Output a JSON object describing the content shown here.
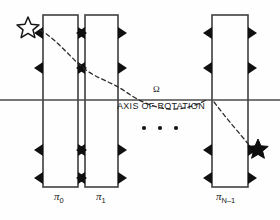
{
  "diagram": {
    "axis": {
      "label": "AXIS OF ROTATION",
      "omega_symbol": "Ω",
      "y": 100,
      "x_start": 0,
      "x_end": 280
    },
    "ellipsis": "•  •  •",
    "plates": [
      {
        "id": "plate-0",
        "label": "π",
        "subscript": "0",
        "x": 43,
        "width": 35,
        "y": 15,
        "height": 172
      },
      {
        "id": "plate-1",
        "label": "π",
        "subscript": "1",
        "x": 85,
        "width": 33,
        "y": 15,
        "height": 172
      },
      {
        "id": "plate-n-1",
        "label": "π",
        "subscript": "N–1",
        "x": 212,
        "width": 36,
        "y": 15,
        "height": 172
      }
    ],
    "markers": {
      "name": "triangle-marker",
      "rows_y": [
        33,
        68,
        150,
        178
      ],
      "color": "#111111"
    },
    "ray": {
      "name": "dashed-ray-path",
      "style": "dashed",
      "start_star": "hollow-star",
      "end_star": "filled-star",
      "start_point": [
        30,
        26
      ],
      "end_point": [
        256,
        148
      ],
      "path": "M 44 31 C 62 38, 74 60, 92 73 C 104 81, 118 86, 132 98 C 150 112, 170 120, 190 128"
    },
    "stars": {
      "start": {
        "name": "hollow-star",
        "cx": 28,
        "cy": 27,
        "r": 10,
        "filled": false
      },
      "end": {
        "name": "filled-star",
        "cx": 258,
        "cy": 148,
        "r": 9,
        "filled": true
      }
    },
    "colors": {
      "stroke": "#3a3a3a",
      "marker": "#101010",
      "text": "#1a1a1a",
      "background": "#ffffff"
    }
  }
}
